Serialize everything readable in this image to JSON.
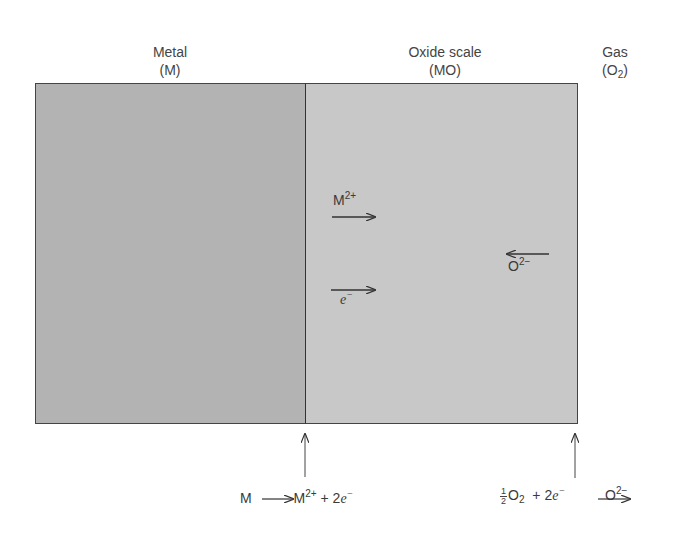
{
  "regions": {
    "metal": {
      "title": "Metal",
      "symbol": "(M)",
      "color": "#b3b3b3"
    },
    "oxide": {
      "title": "Oxide scale",
      "symbol": "(MO)",
      "color": "#c8c8c8"
    },
    "gas": {
      "title": "Gas",
      "symbol_prefix": "(O",
      "symbol_sub": "2",
      "symbol_suffix": ")"
    }
  },
  "species": {
    "metal_ion": {
      "base": "M",
      "charge": "2+",
      "direction": "right"
    },
    "electron": {
      "base": "e",
      "charge": "−",
      "direction": "right"
    },
    "oxide_ion": {
      "base": "O",
      "charge": "2−",
      "direction": "left"
    }
  },
  "reactions": {
    "anodic": {
      "reactant": "M",
      "product_base": "M",
      "product_charge": "2+",
      "plus": "+ 2",
      "electron": "e",
      "electron_charge": "−"
    },
    "cathodic": {
      "frac_num": "1",
      "frac_den": "2",
      "reactant_base": "O",
      "reactant_sub": "2",
      "plus": "+ 2",
      "electron": "e",
      "electron_charge": "−",
      "product_base": "O",
      "product_charge": "2−"
    }
  }
}
